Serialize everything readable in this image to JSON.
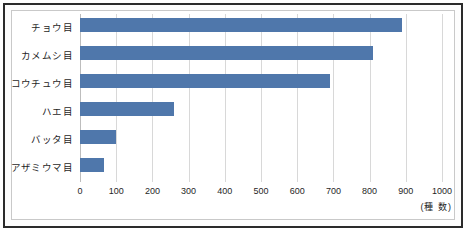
{
  "chart_data": {
    "type": "bar",
    "orientation": "horizontal",
    "title": "",
    "xlabel": "(種 数)",
    "ylabel": "",
    "xlim": [
      0,
      1000
    ],
    "xticks": [
      "0",
      "100",
      "200",
      "300",
      "400",
      "500",
      "600",
      "700",
      "800",
      "900",
      "1000"
    ],
    "grid": true,
    "legend": false,
    "categories": [
      "チョウ目",
      "カメムシ目",
      "コウチュウ目",
      "ハエ目",
      "バッタ目",
      "アザミウマ目"
    ],
    "values": [
      890,
      810,
      690,
      260,
      100,
      65
    ],
    "series": [
      {
        "name": "種数",
        "values": [
          890,
          810,
          690,
          260,
          100,
          65
        ],
        "color": "#4f77ab"
      }
    ]
  },
  "style": {
    "bar_color": "#4f77ab",
    "grid_color": "#d8d8d8",
    "frame_color": "#2b2b2b",
    "inner_frame_color": "#c9c9c9",
    "text_color": "#1f1f1f"
  }
}
